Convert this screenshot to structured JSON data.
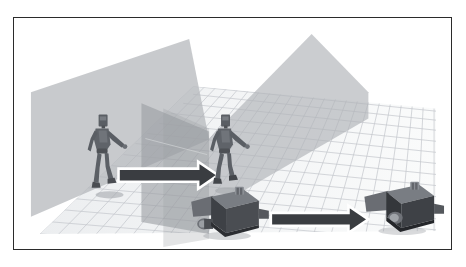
{
  "figure": {
    "title": "",
    "caption": "",
    "domain": "3d-simulation-viewport",
    "frame": {
      "border_color": "#2b2b2b",
      "background_color": "#ffffff"
    }
  },
  "scene": {
    "name": "robot-motion-retargeting-scene",
    "background_color": "#ffffff",
    "floor": {
      "name": "grid-floor",
      "grid_line_color": "#b9bcc1",
      "grid_line_color_shaded": "#8f9399",
      "fill_color": "#f4f5f6",
      "fill_color_shaded": "#c9ccd0",
      "columns": 22,
      "rows": 14
    },
    "planes": [
      {
        "name": "left-translucent-plane",
        "label": "",
        "fill_color": "#b4b7bb",
        "opacity": 0.72
      },
      {
        "name": "right-translucent-plane",
        "label": "",
        "fill_color": "#b4b7bb",
        "opacity": 0.72
      },
      {
        "name": "center-vertical-plane",
        "label": "",
        "fill_color": "#9a9da2",
        "opacity": 0.62
      }
    ],
    "actors": [
      {
        "name": "humanoid-robot-source",
        "label": "",
        "position_label": "left",
        "body_color": "#5d6167",
        "shadow_color": "#8b8f95"
      },
      {
        "name": "humanoid-robot-target",
        "label": "",
        "position_label": "right",
        "body_color": "#5d6167",
        "shadow_color": "#8b8f95"
      },
      {
        "name": "box-robot-source",
        "label": "",
        "position_label": "center-bottom",
        "body_color": "#44474c",
        "face_color": "#6d7076",
        "accent_color": "#9b9ea3"
      },
      {
        "name": "box-robot-target",
        "label": "",
        "position_label": "right-bottom",
        "body_color": "#2d3034",
        "face_color": "#6d7076",
        "accent_color": "#9b9ea3"
      }
    ],
    "arrows": [
      {
        "name": "transfer-arrow-humanoid",
        "label": "",
        "fill_color": "#3a3d41",
        "outline_color": "#ffffff",
        "direction": "right"
      },
      {
        "name": "transfer-arrow-box-robot",
        "label": "",
        "fill_color": "#3a3d41",
        "outline_color": "#ffffff",
        "direction": "right"
      }
    ]
  }
}
